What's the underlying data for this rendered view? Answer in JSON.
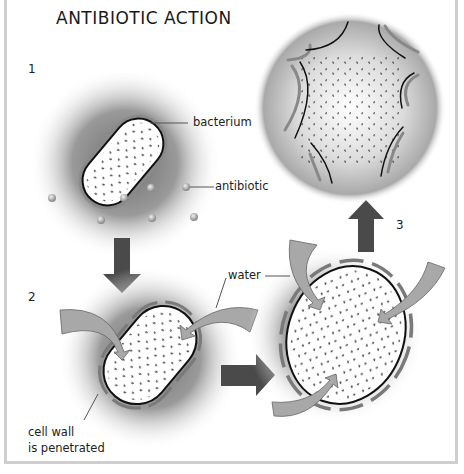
{
  "title": "ANTIBIOTIC ACTION",
  "steps": [
    {
      "number": "1"
    },
    {
      "number": "2"
    },
    {
      "number": "3"
    }
  ],
  "labels": {
    "bacterium": "bacterium",
    "antibiotic": "antibiotic",
    "water": "water",
    "cell_wall_line1": "cell wall",
    "cell_wall_line2": "is penetrated"
  },
  "colors": {
    "halo": "#8c8c8c",
    "arrow_dark": "#4a4a4a",
    "arrow_light": "#a8a8a8",
    "wall": "#7a7a7a",
    "outline": "#111111"
  }
}
